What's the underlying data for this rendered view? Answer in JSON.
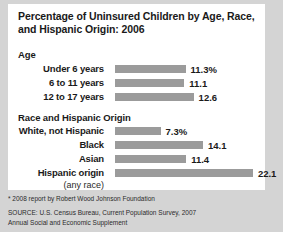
{
  "title": "Percentage of Uninsured Children by Age, Race, and Hispanic Origin: 2006",
  "sections": {
    "age": {
      "heading": "Age"
    },
    "race": {
      "heading": "Race and Hispanic Origin"
    }
  },
  "hispanic_sublabel": "(any race)",
  "footnote": "* 2008 report by Robert Wood Johnson Foundation",
  "source": {
    "line1": "SOURCE: U.S. Census Bureau, Current Population Survey, 2007",
    "line2": "Annual Social and Economic Supplement"
  },
  "colors": {
    "bar": "#9b9b9b",
    "panel": "#ffffff",
    "background": "#d4d4d4",
    "text": "#1a1a1a"
  },
  "chart_data": {
    "type": "bar",
    "title": "Percentage of Uninsured Children by Age, Race, and Hispanic Origin: 2006",
    "xlabel": "",
    "ylabel": "",
    "orientation": "horizontal",
    "xlim": [
      0,
      22.1
    ],
    "grid": false,
    "legend": false,
    "groups": [
      {
        "name": "Age",
        "categories": [
          "Under 6 years",
          "6 to 11 years",
          "12 to 17 years"
        ],
        "values": [
          11.3,
          11.1,
          12.6
        ],
        "value_labels": [
          "11.3%",
          "11.1",
          "12.6"
        ]
      },
      {
        "name": "Race and Hispanic Origin",
        "categories": [
          "White, not Hispanic",
          "Black",
          "Asian",
          "Hispanic origin"
        ],
        "values": [
          7.3,
          14.1,
          11.4,
          22.1
        ],
        "value_labels": [
          "7.3%",
          "14.1",
          "11.4",
          "22.1"
        ]
      }
    ]
  }
}
